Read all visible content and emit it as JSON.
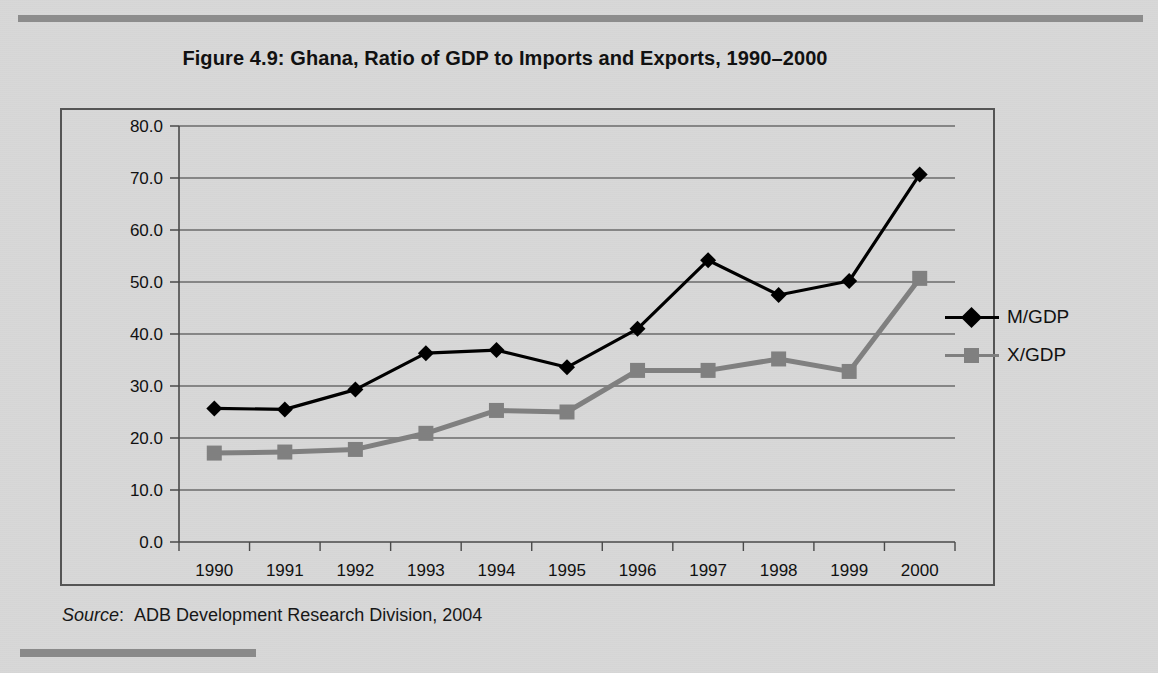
{
  "figure": {
    "title": "Figure 4.9:  Ghana, Ratio of GDP to Imports and Exports, 1990–2000",
    "source_label": "Source",
    "source_separator": ":",
    "source_text": "ADB Development Research Division, 2004"
  },
  "legend": {
    "position": "right",
    "items": [
      {
        "label": "M/GDP",
        "color": "#000000",
        "marker": "diamond"
      },
      {
        "label": "X/GDP",
        "color": "#808080",
        "marker": "square"
      }
    ]
  },
  "chart_data": {
    "type": "line",
    "title": "Figure 4.9:  Ghana, Ratio of GDP to Imports and Exports, 1990–2000",
    "xlabel": "",
    "ylabel": "",
    "grid": true,
    "legend_position": "right",
    "categories": [
      "1990",
      "1991",
      "1992",
      "1993",
      "1994",
      "1995",
      "1996",
      "1997",
      "1998",
      "1999",
      "2000"
    ],
    "x": [
      1990,
      1991,
      1992,
      1993,
      1994,
      1995,
      1996,
      1997,
      1998,
      1999,
      2000
    ],
    "ylim": [
      0.0,
      80.0
    ],
    "yticks": [
      "0.0",
      "10.0",
      "20.0",
      "30.0",
      "40.0",
      "50.0",
      "60.0",
      "70.0",
      "80.0"
    ],
    "ytick_values": [
      0.0,
      10.0,
      20.0,
      30.0,
      40.0,
      50.0,
      60.0,
      70.0,
      80.0
    ],
    "series": [
      {
        "name": "M/GDP",
        "color": "#000000",
        "marker": "diamond",
        "values": [
          25.7,
          25.5,
          29.3,
          36.3,
          36.9,
          33.6,
          41.0,
          54.2,
          47.5,
          50.2,
          70.7
        ]
      },
      {
        "name": "X/GDP",
        "color": "#808080",
        "marker": "square",
        "values": [
          17.1,
          17.3,
          17.8,
          20.9,
          25.3,
          25.0,
          33.0,
          33.0,
          35.2,
          32.8,
          50.7
        ]
      }
    ]
  }
}
